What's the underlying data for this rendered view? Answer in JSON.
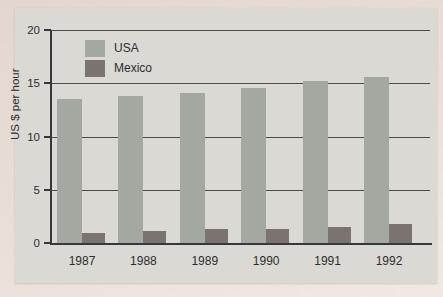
{
  "chart_data": {
    "type": "bar",
    "title": "",
    "xlabel": "",
    "ylabel": "US $ per hour",
    "categories": [
      "1987",
      "1988",
      "1989",
      "1990",
      "1991",
      "1992"
    ],
    "series": [
      {
        "name": "USA",
        "color": "#a3a8a0",
        "values": [
          13.5,
          13.8,
          14.1,
          14.6,
          15.2,
          15.6
        ]
      },
      {
        "name": "Mexico",
        "color": "#7a7370",
        "values": [
          0.9,
          1.1,
          1.3,
          1.3,
          1.5,
          1.8
        ]
      }
    ],
    "ylim": [
      0,
      20
    ],
    "yticks": [
      0,
      5,
      10,
      15,
      20
    ],
    "grid": true,
    "legend_position": "top-left-inside"
  },
  "colors": {
    "paper": "#e9ded6",
    "panel": "#dbd9d4",
    "axis": "#383838",
    "gridline": "#4c4c4c",
    "usa_bar": "#a3a8a0",
    "mexico_bar": "#7a7370"
  }
}
